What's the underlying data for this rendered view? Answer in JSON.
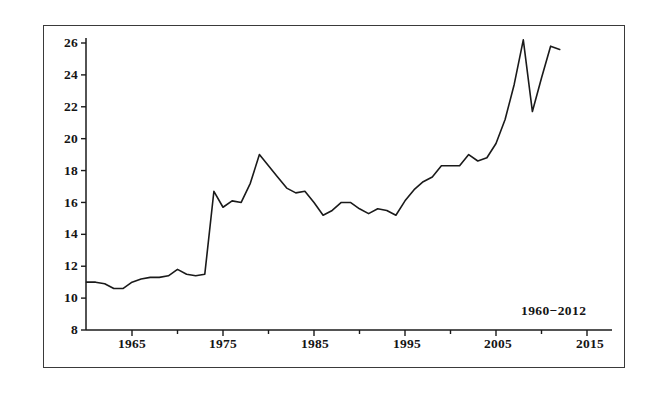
{
  "chart_data": {
    "type": "line",
    "title": "",
    "subtitle": "",
    "xlabel": "",
    "ylabel": "",
    "annotation": "1960–2012",
    "annotation_x": 2006,
    "annotation_y": 9.1,
    "grid": false,
    "legend": false,
    "legend_position": "none",
    "xlim": [
      1960,
      2017
    ],
    "ylim": [
      8,
      27
    ],
    "xticks": [
      1965,
      1975,
      1985,
      1995,
      2005,
      2015
    ],
    "xtick_labels": [
      "1965",
      "1975",
      "1985",
      "1995",
      "2005",
      "2015"
    ],
    "xminor_ticks": [
      1970,
      1980,
      1990,
      2000,
      2010
    ],
    "yticks": [
      8,
      10,
      12,
      14,
      16,
      18,
      20,
      22,
      24,
      26
    ],
    "ytick_labels": [
      "8",
      "10",
      "12",
      "14",
      "16",
      "18",
      "20",
      "22",
      "24",
      "26"
    ],
    "line_color": "#1a1a1a",
    "line_width": 1.6,
    "series": [
      {
        "name": "value",
        "x": [
          1960,
          1961,
          1962,
          1963,
          1964,
          1965,
          1966,
          1967,
          1968,
          1969,
          1970,
          1971,
          1972,
          1973,
          1974,
          1975,
          1976,
          1977,
          1978,
          1979,
          1980,
          1981,
          1982,
          1983,
          1984,
          1985,
          1986,
          1987,
          1988,
          1989,
          1990,
          1991,
          1992,
          1993,
          1994,
          1995,
          1996,
          1997,
          1998,
          1999,
          2000,
          2001,
          2002,
          2003,
          2004,
          2005,
          2006,
          2007,
          2008,
          2009,
          2010,
          2011,
          2012
        ],
        "values": [
          11.0,
          11.0,
          10.9,
          10.6,
          10.6,
          11.0,
          11.2,
          11.3,
          11.3,
          11.4,
          11.8,
          11.5,
          11.4,
          11.5,
          16.7,
          15.7,
          16.1,
          16.0,
          17.2,
          19.0,
          18.3,
          17.6,
          16.9,
          16.6,
          16.7,
          16.0,
          15.2,
          15.5,
          16.0,
          16.0,
          15.6,
          15.3,
          15.6,
          15.5,
          15.2,
          16.1,
          16.8,
          17.3,
          17.6,
          18.3,
          18.3,
          18.3,
          19.0,
          18.6,
          18.8,
          19.7,
          21.2,
          23.4,
          26.2,
          21.7,
          23.8,
          25.8,
          25.6
        ]
      }
    ]
  },
  "axes": {
    "y_tick_labels": [
      "26",
      "24",
      "22",
      "20",
      "18",
      "16",
      "14",
      "12",
      "10",
      "8"
    ],
    "x_tick_labels": [
      "1965",
      "1975",
      "1985",
      "1995",
      "2005",
      "2015"
    ]
  },
  "annotation": {
    "text": "1960−2012"
  }
}
